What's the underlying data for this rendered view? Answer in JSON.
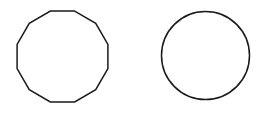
{
  "canvas": {
    "width": 269,
    "height": 114,
    "background_color": "#ffffff"
  },
  "style": {
    "stroke_color": "#1a1a1a",
    "stroke_width": 1.5,
    "fill": "none"
  },
  "figure": {
    "shape_count": 2
  },
  "shapes": [
    {
      "id": "polygon",
      "name": "dodecagon",
      "label": "regular dodecagon",
      "sides": 12,
      "center_x": 62.5,
      "center_y": 56.5,
      "circumradius": 47,
      "rotation_deg": 15,
      "bounds": {
        "left": 14,
        "top": 12,
        "right": 111,
        "bottom": 101
      },
      "stroke_color": "#1a1a1a",
      "fill": "none"
    },
    {
      "id": "circle",
      "name": "circle",
      "label": "circle",
      "sides": 0,
      "center_x": 205.5,
      "center_y": 55.5,
      "radius": 44,
      "bounds": {
        "left": 161.5,
        "top": 11.5,
        "right": 249.5,
        "bottom": 99.5
      },
      "stroke_color": "#1a1a1a",
      "fill": "none"
    }
  ]
}
